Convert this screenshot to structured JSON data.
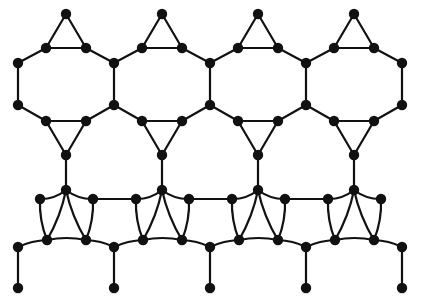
{
  "diagram": {
    "title": "Molecular lattice network schematic",
    "type": "node-link-lattice",
    "width": 423,
    "height": 307,
    "background_color": "#ffffff",
    "bond_color": "#111111",
    "atom_color": "#111111",
    "bond_width": 2.2,
    "atom_radius": 5.2,
    "atom_radius_small": 4.4
  },
  "geometry": {
    "period_x": 96,
    "columns": 4,
    "rows": {
      "cap_apex_y": 14,
      "cap_shoulder_y": 48,
      "hex_upper_y": 63,
      "hex_lower_y": 105,
      "tri_shoulder_y": 121,
      "tri_apex_y": 155,
      "quad_top_y": 190,
      "quad_shoulder_y": 199,
      "quad_bottom_y": 240,
      "terminal_anchor_y": 247,
      "pendant_y": 288
    },
    "x_anchors_main": [
      18,
      114,
      210,
      306,
      402
    ],
    "x_anchors_cap_apex": [
      66,
      162,
      258,
      354
    ],
    "x_anchors_cap_shoulder_left": [
      46,
      142,
      238,
      334
    ],
    "x_anchors_cap_shoulder_right": [
      86,
      182,
      278,
      374
    ],
    "x_anchors_tri_apex": [
      66,
      162,
      258,
      354
    ],
    "x_anchors_quad_top": [
      66,
      162,
      258,
      354
    ],
    "x_anchors_quad_shoulder_left": [
      40,
      136,
      232,
      328
    ],
    "x_anchors_quad_shoulder_right": [
      93,
      189,
      285,
      381
    ],
    "x_anchors_quad_bottom_left": [
      47,
      143,
      239,
      335
    ],
    "x_anchors_quad_bottom_right": [
      86,
      182,
      278,
      374
    ],
    "x_anchors_terminal": [
      18,
      114,
      210,
      306,
      402
    ],
    "x_anchors_pendant": [
      18,
      114,
      210,
      306,
      402
    ]
  },
  "counts": {
    "atoms_total": 78,
    "hexagon_rings": 4,
    "triangular_caps_top": 4,
    "triangular_caps_middle": 4,
    "quadrilateral_rings": 8,
    "pendant_bonds": 5
  },
  "labels": {
    "top_caps": "three-membered capping bridge",
    "hexagon_band": "fused six-membered ring band",
    "quad_band": "puckered four-membered ring band",
    "pendant": "terminal pendant bond"
  }
}
